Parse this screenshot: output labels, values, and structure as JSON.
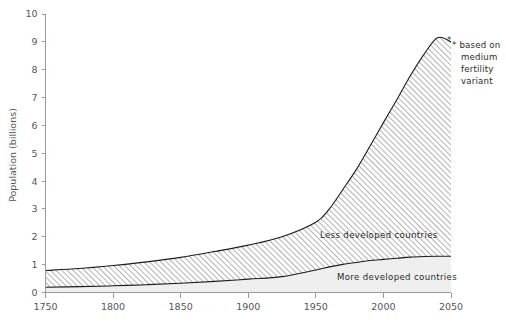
{
  "chart_data": {
    "type": "area",
    "stacked": true,
    "title": "",
    "xlabel": "",
    "ylabel": "Population (billions)",
    "xlim": [
      1750,
      2050
    ],
    "ylim": [
      0,
      10
    ],
    "grid": false,
    "legend_position": "inline-annotation",
    "x_ticks": [
      "1750",
      "1800",
      "1850",
      "1900",
      "1950",
      "2000",
      "2050"
    ],
    "x_tick_values": [
      1750,
      1800,
      1850,
      1900,
      1950,
      2000,
      2050
    ],
    "y_ticks": [
      "0",
      "1",
      "2",
      "3",
      "4",
      "5",
      "6",
      "7",
      "8",
      "9",
      "10"
    ],
    "y_tick_values": [
      0,
      1,
      2,
      3,
      4,
      5,
      6,
      7,
      8,
      9,
      10
    ],
    "x": [
      1750,
      1775,
      1800,
      1825,
      1850,
      1875,
      1900,
      1925,
      1950,
      1960,
      1970,
      1980,
      1990,
      2000,
      2010,
      2020,
      2030,
      2040,
      2050
    ],
    "series": [
      {
        "name": "More developed countries",
        "label": "More developed countries",
        "fill": "#efefef",
        "values": [
          0.19,
          0.21,
          0.24,
          0.28,
          0.33,
          0.4,
          0.48,
          0.57,
          0.81,
          0.92,
          1.01,
          1.08,
          1.15,
          1.19,
          1.23,
          1.27,
          1.29,
          1.3,
          1.3
        ]
      },
      {
        "name": "Less developed countries",
        "label": "Less developed countries",
        "fill": "hatch-diagonal",
        "values": [
          0.6,
          0.65,
          0.73,
          0.82,
          0.93,
          1.07,
          1.22,
          1.43,
          1.71,
          2.08,
          2.69,
          3.34,
          4.1,
          4.91,
          5.7,
          6.52,
          7.26,
          7.85,
          7.7
        ]
      }
    ],
    "totals": [
      0.79,
      0.86,
      0.97,
      1.1,
      1.26,
      1.47,
      1.7,
      2.0,
      2.52,
      3.0,
      3.7,
      4.42,
      5.25,
      6.1,
      6.93,
      7.79,
      8.55,
      9.15,
      9.0
    ],
    "annotations": [
      {
        "name": "fertility-variant-note",
        "marker": "*",
        "lines": [
          "* based on",
          "medium",
          "fertility",
          "variant"
        ],
        "text": "* based on medium fertility variant",
        "anchor_x": 2050,
        "anchor_y": 9.0
      }
    ]
  },
  "labels": {
    "y_axis_title": "Population (billions)",
    "less_developed": "Less developed countries",
    "more_developed": "More developed countries"
  },
  "note": {
    "line1": "* based on",
    "line2": "medium",
    "line3": "fertility",
    "line4": "variant",
    "marker": "*"
  },
  "colors": {
    "axis": "#9a9a9a",
    "curve": "#1c1c1c",
    "lower_band": "#efefef",
    "hatch_line": "#6e6e6e",
    "text": "#55555a",
    "background": "#ffffff"
  }
}
